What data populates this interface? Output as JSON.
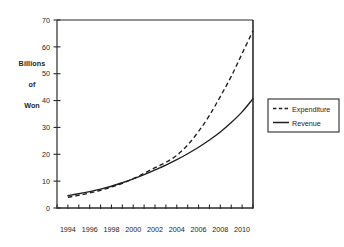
{
  "chart_data": {
    "type": "line",
    "title": "",
    "xlabel": "",
    "ylabel": "Billions of Won",
    "ylabel_lines": [
      "Billions",
      "of",
      "Won"
    ],
    "ylim": [
      0,
      70
    ],
    "xlim": [
      1993,
      2011
    ],
    "grid": false,
    "legend_position": "right-outside",
    "y_ticks": [
      0,
      10,
      20,
      30,
      40,
      50,
      60,
      70
    ],
    "y_tick_labels": [
      "0",
      "10",
      "20",
      "30",
      "40",
      "50",
      "60",
      "70"
    ],
    "x_tick_labels": [
      "1994",
      "1996",
      "1998",
      "2000",
      "2002",
      "2004",
      "2006",
      "2008",
      "2010"
    ],
    "x_tick_values": [
      1994,
      1996,
      1998,
      2000,
      2002,
      2004,
      2006,
      2008,
      2010
    ],
    "x_minor_ticks": [
      1993,
      1994,
      1995,
      1996,
      1997,
      1998,
      1999,
      2000,
      2001,
      2002,
      2003,
      2004,
      2005,
      2006,
      2007,
      2008,
      2009,
      2010,
      2011
    ],
    "x": [
      1994,
      1995,
      1996,
      1997,
      1998,
      1999,
      2000,
      2001,
      2002,
      2003,
      2004,
      2005,
      2006,
      2007,
      2008,
      2009,
      2010,
      2011
    ],
    "series": [
      {
        "name": "Expenditure",
        "style": "dashed",
        "color": "#1f1f1f",
        "values": [
          4.0,
          4.7,
          5.6,
          6.6,
          7.8,
          9.2,
          10.9,
          12.9,
          15.0,
          17.0,
          19.6,
          23.5,
          28.5,
          34.5,
          41.5,
          49.0,
          57.5,
          66.0
        ]
      },
      {
        "name": "Revenue",
        "style": "solid",
        "color": "#1f1f1f",
        "values": [
          4.6,
          5.3,
          6.1,
          7.0,
          8.1,
          9.4,
          10.8,
          12.4,
          14.2,
          16.0,
          18.0,
          20.2,
          22.6,
          25.3,
          28.3,
          31.8,
          35.8,
          40.7
        ]
      }
    ],
    "annotations": [
      "Curves cross near 2004 at about 17 billion Won",
      "Expenditure exceeds Revenue after 2004"
    ]
  },
  "legend": {
    "items": [
      {
        "label": "Expenditure",
        "style": "dashed"
      },
      {
        "label": "Revenue",
        "style": "solid"
      }
    ]
  }
}
